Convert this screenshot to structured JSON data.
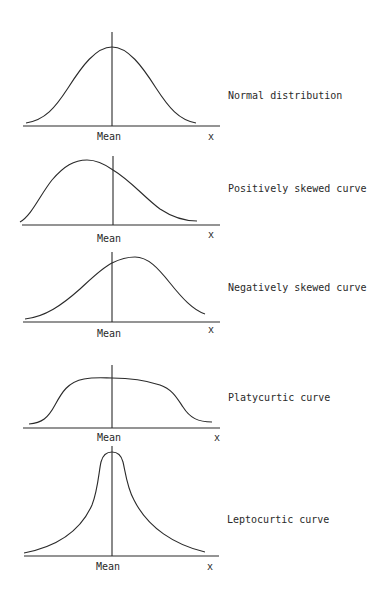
{
  "panels": [
    {
      "id": "normal",
      "title": "Normal distribution",
      "mean_label": "Mean",
      "x_label": "x"
    },
    {
      "id": "positive-skew",
      "title": "Positively skewed curve",
      "mean_label": "Mean",
      "x_label": "x"
    },
    {
      "id": "negative-skew",
      "title": "Negatively skewed curve",
      "mean_label": "Mean",
      "x_label": "x"
    },
    {
      "id": "platykurtic",
      "title": "Platycurtic curve",
      "mean_label": "Mean",
      "x_label": "x"
    },
    {
      "id": "leptokurtic",
      "title": "Leptocurtic curve",
      "mean_label": "Mean",
      "x_label": "x"
    }
  ],
  "colors": {
    "ink": "#2a2a2a",
    "background": "#ffffff"
  }
}
